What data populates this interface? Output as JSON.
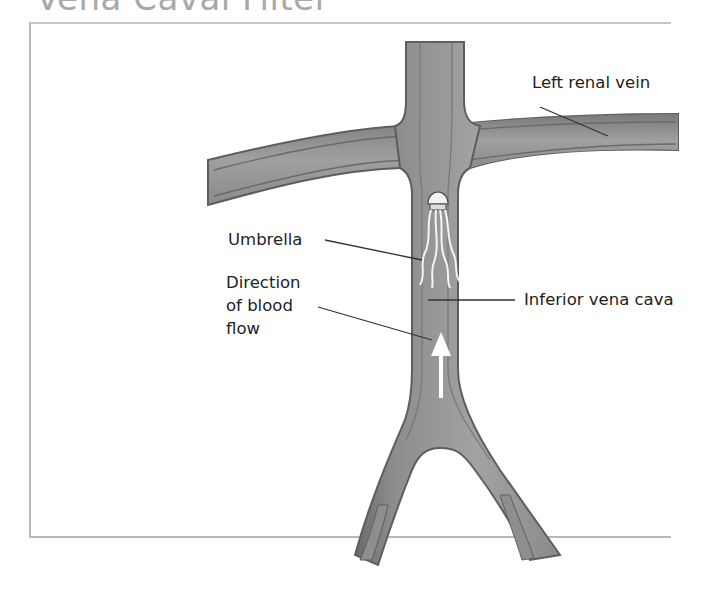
{
  "title": "Vena Caval Filter",
  "labels": {
    "left_renal_vein": "Left renal vein",
    "umbrella": "Umbrella",
    "direction_line1": "Direction",
    "direction_line2": "of blood",
    "direction_line3": "flow",
    "inferior_vena_cava": "Inferior vena cava"
  },
  "colors": {
    "vein_fill": "#9a9a9a",
    "vein_edge": "#5e5e5e",
    "arrow": "#ffffff",
    "leader_line": "#333333"
  }
}
